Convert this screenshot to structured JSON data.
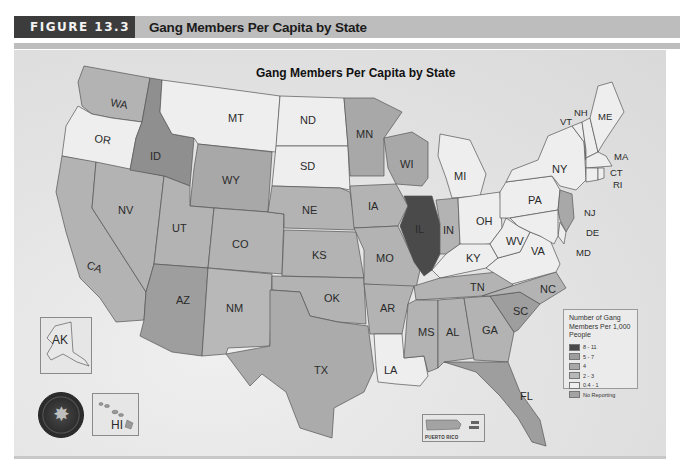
{
  "header": {
    "figure_label": "FIGURE 13.3",
    "figure_title": "Gang Members Per Capita by State"
  },
  "map": {
    "title": "Gang Members Per Capita by State",
    "legend": {
      "title": "Number of Gang Members Per 1,000 People",
      "items": [
        {
          "label": "8 - 11",
          "color": "#4a4a4a"
        },
        {
          "label": "5 - 7",
          "color": "#9e9e9e"
        },
        {
          "label": "4",
          "color": "#a8a8a8"
        },
        {
          "label": "2 - 3",
          "color": "#b8b8b8"
        },
        {
          "label": "0.4 - 1",
          "color": "#eeeeee"
        },
        {
          "label": "No Reporting",
          "color": "#a3a3a3"
        }
      ]
    },
    "insets": {
      "alaska": "AK",
      "hawaii": "HI",
      "puerto_rico": "PUERTO RICO"
    },
    "states": {
      "WA": "WA",
      "OR": "OR",
      "CA": "CA",
      "NV": "NV",
      "ID": "ID",
      "MT": "MT",
      "WY": "WY",
      "UT": "UT",
      "AZ": "AZ",
      "CO": "CO",
      "NM": "NM",
      "ND": "ND",
      "SD": "SD",
      "NE": "NE",
      "KS": "KS",
      "OK": "OK",
      "TX": "TX",
      "MN": "MN",
      "IA": "IA",
      "MO": "MO",
      "AR": "AR",
      "LA": "LA",
      "WI": "WI",
      "IL": "IL",
      "MI": "MI",
      "IN": "IN",
      "OH": "OH",
      "KY": "KY",
      "TN": "TN",
      "MS": "MS",
      "AL": "AL",
      "GA": "GA",
      "FL": "FL",
      "SC": "SC",
      "NC": "NC",
      "VA": "VA",
      "WV": "WV",
      "PA": "PA",
      "NY": "NY",
      "VT": "VT",
      "NH": "NH",
      "ME": "ME",
      "MA": "MA",
      "CT": "CT",
      "RI": "RI",
      "NJ": "NJ",
      "DE": "DE",
      "MD": "MD"
    },
    "category_colors": {
      "c8_11": "#4a4a4a",
      "c5_7": "#9e9e9e",
      "c4": "#a8a8a8",
      "c2_3": "#b8b8b8",
      "c04_1": "#eeeeee"
    }
  }
}
